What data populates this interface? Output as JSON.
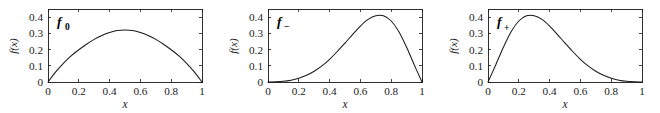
{
  "figure": {
    "background_color": "#ffffff",
    "line_color": "#1a1a1a",
    "panel_count": 3
  },
  "chart_data": [
    {
      "type": "line",
      "title": "",
      "label": "f",
      "label_sub": "0",
      "xlabel": "x",
      "ylabel": "f(x)",
      "xlim": [
        0,
        1
      ],
      "ylim": [
        0,
        0.45
      ],
      "xticks": [
        0,
        0.2,
        0.4,
        0.6,
        0.8,
        1
      ],
      "xticklabels": [
        "0",
        "0.2",
        "0.4",
        "0.6",
        "0.8",
        "1"
      ],
      "yticks": [
        0,
        0.1,
        0.2,
        0.3,
        0.4
      ],
      "yticklabels": [
        "0",
        "0.1",
        "0.2",
        "0.3",
        "0.4"
      ],
      "grid": false,
      "legend": "none",
      "peak_x": 0.5,
      "peak_y": 0.32,
      "x": [
        0,
        0.05,
        0.1,
        0.15,
        0.2,
        0.25,
        0.3,
        0.35,
        0.4,
        0.45,
        0.5,
        0.55,
        0.6,
        0.65,
        0.7,
        0.75,
        0.8,
        0.85,
        0.9,
        0.95,
        1
      ],
      "values": [
        0,
        0.062,
        0.115,
        0.161,
        0.199,
        0.233,
        0.263,
        0.287,
        0.305,
        0.317,
        0.32,
        0.317,
        0.305,
        0.287,
        0.263,
        0.233,
        0.199,
        0.161,
        0.115,
        0.062,
        0
      ]
    },
    {
      "type": "line",
      "title": "",
      "label": "f",
      "label_sub": "−",
      "xlabel": "x",
      "ylabel": "f(x)",
      "xlim": [
        0,
        1
      ],
      "ylim": [
        0,
        0.45
      ],
      "xticks": [
        0,
        0.2,
        0.4,
        0.6,
        0.8,
        1
      ],
      "xticklabels": [
        "0",
        "0.2",
        "0.4",
        "0.6",
        "0.8",
        "1"
      ],
      "yticks": [
        0,
        0.1,
        0.2,
        0.3,
        0.4
      ],
      "yticklabels": [
        "0",
        "0.1",
        "0.2",
        "0.3",
        "0.4"
      ],
      "grid": false,
      "legend": "none",
      "peak_x": 0.67,
      "peak_y": 0.41,
      "x": [
        0,
        0.05,
        0.1,
        0.15,
        0.2,
        0.25,
        0.3,
        0.35,
        0.4,
        0.45,
        0.5,
        0.55,
        0.6,
        0.65,
        0.7,
        0.75,
        0.8,
        0.85,
        0.9,
        0.95,
        1
      ],
      "values": [
        0,
        0.001,
        0.004,
        0.011,
        0.023,
        0.041,
        0.066,
        0.099,
        0.14,
        0.188,
        0.24,
        0.294,
        0.345,
        0.386,
        0.409,
        0.408,
        0.376,
        0.31,
        0.214,
        0.105,
        0
      ]
    },
    {
      "type": "line",
      "title": "",
      "label": "f",
      "label_sub": "+",
      "xlabel": "x",
      "ylabel": "f(x)",
      "xlim": [
        0,
        1
      ],
      "ylim": [
        0,
        0.45
      ],
      "xticks": [
        0,
        0.2,
        0.4,
        0.6,
        0.8,
        1
      ],
      "xticklabels": [
        "0",
        "0.2",
        "0.4",
        "0.6",
        "0.8",
        "1"
      ],
      "yticks": [
        0,
        0.1,
        0.2,
        0.3,
        0.4
      ],
      "yticklabels": [
        "0",
        "0.1",
        "0.2",
        "0.3",
        "0.4"
      ],
      "grid": false,
      "legend": "none",
      "peak_x": 0.33,
      "peak_y": 0.41,
      "x": [
        0,
        0.05,
        0.1,
        0.15,
        0.2,
        0.25,
        0.3,
        0.35,
        0.4,
        0.45,
        0.5,
        0.55,
        0.6,
        0.65,
        0.7,
        0.75,
        0.8,
        0.85,
        0.9,
        0.95,
        1
      ],
      "values": [
        0,
        0.105,
        0.214,
        0.31,
        0.376,
        0.408,
        0.409,
        0.386,
        0.345,
        0.294,
        0.24,
        0.188,
        0.14,
        0.099,
        0.066,
        0.041,
        0.023,
        0.011,
        0.004,
        0.001,
        0
      ]
    }
  ]
}
